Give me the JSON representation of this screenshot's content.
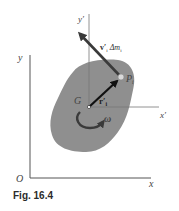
{
  "figure": {
    "caption": "Fig. 16.4",
    "colors": {
      "body_fill": "#8f8f8f",
      "axis": "#555555",
      "arrow": "#3a3a3a",
      "vector_r": "#111111"
    },
    "labels": {
      "origin": "O",
      "x_axis": "x",
      "y_axis": "y",
      "x_prime_axis": "x′",
      "y_prime_axis": "y′",
      "center_of_mass": "G",
      "particle": "P",
      "particle_subscript": "i",
      "position_vector": "r′",
      "position_vector_subscript": "i",
      "momentum_v": "v′",
      "momentum_v_subscript": "i",
      "momentum_dm": "Δm",
      "momentum_dm_subscript": "i",
      "angular_velocity": "ω"
    }
  }
}
